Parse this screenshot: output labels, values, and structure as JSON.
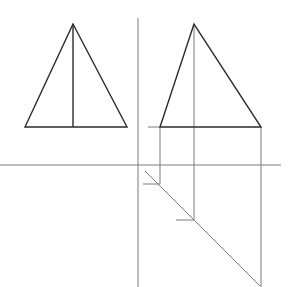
{
  "diagram": {
    "title": "",
    "colors": {
      "background": "#ffffff",
      "outline": "#2b2b2b",
      "construction": "#7a7a7a"
    },
    "views": {
      "left_view": {
        "apex": [
          73,
          24
        ],
        "base_left": [
          25,
          127
        ],
        "base_right": [
          127,
          127
        ],
        "axis_bottom": [
          73,
          127
        ]
      },
      "right_view": {
        "apex": [
          194,
          24
        ],
        "base_left": [
          160,
          127
        ],
        "base_right": [
          261,
          127
        ]
      }
    },
    "construction": {
      "vertical_axis": {
        "x": 138,
        "y1": 18,
        "y2": 287
      },
      "horizontal_axis": {
        "y": 165,
        "x1": 0,
        "x2": 281
      },
      "base_extension": {
        "y": 127,
        "x1": 148,
        "x2": 160
      },
      "miter_line": {
        "x1": 145,
        "y1": 171,
        "x2": 260,
        "y2": 286
      },
      "projector_1": {
        "x": 160,
        "y1": 127,
        "y2": 184
      },
      "projector_2": {
        "x": 194,
        "y1": 24,
        "y2": 220
      },
      "projector_3": {
        "x": 261,
        "y1": 127,
        "y2": 287
      },
      "tick_1": {
        "y": 184,
        "x1": 143,
        "x2": 160
      },
      "tick_2": {
        "y": 220,
        "x1": 176,
        "x2": 194
      }
    }
  }
}
